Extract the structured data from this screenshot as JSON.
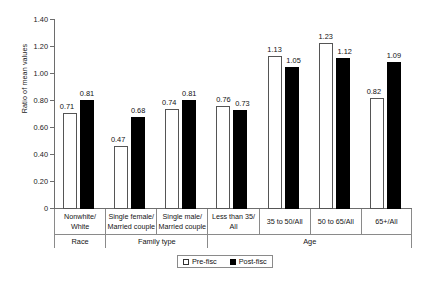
{
  "chart_data": {
    "type": "bar",
    "title": "",
    "xlabel": "",
    "ylabel": "Ratio of mean values",
    "ylim": [
      0,
      1.4
    ],
    "ytick_labels": [
      "0",
      "0.20",
      "0.40",
      "0.60",
      "0.80",
      "1.00",
      "1.20",
      "1.40"
    ],
    "ytick_values": [
      0,
      0.2,
      0.4,
      0.6,
      0.8,
      1.0,
      1.2,
      1.4
    ],
    "grid": false,
    "legend_position": "bottom-center",
    "categories": [
      "Nonwhite/ White",
      "Single female/ Married couple",
      "Single male/ Married couple",
      "Less than 35/ All",
      "35 to 50/All",
      "50 to 65/All",
      "65+/All"
    ],
    "category_lines": [
      [
        "Nonwhite/",
        "White"
      ],
      [
        "Single female/",
        "Married couple"
      ],
      [
        "Single male/",
        "Married couple"
      ],
      [
        "Less than 35/",
        "All"
      ],
      [
        "35 to 50/All",
        ""
      ],
      [
        "50 to 65/All",
        ""
      ],
      [
        "65+/All",
        ""
      ]
    ],
    "groups": [
      {
        "label": "Race",
        "span": 1
      },
      {
        "label": "Family type",
        "span": 2
      },
      {
        "label": "Age",
        "span": 4
      }
    ],
    "series": [
      {
        "name": "Pre-fisc",
        "color": "#ffffff",
        "values": [
          0.71,
          0.47,
          0.74,
          0.76,
          1.13,
          1.23,
          0.82
        ],
        "labels": [
          "0.71",
          "0.47",
          "0.74",
          "0.76",
          "1.13",
          "1.23",
          "0.82"
        ]
      },
      {
        "name": "Post-fisc",
        "color": "#000000",
        "values": [
          0.81,
          0.68,
          0.81,
          0.73,
          1.05,
          1.12,
          1.09
        ],
        "labels": [
          "0.81",
          "0.68",
          "0.81",
          "0.73",
          "1.05",
          "1.12",
          "1.09"
        ]
      }
    ]
  },
  "legend": {
    "items": [
      {
        "label": "Pre-fisc",
        "swatch": "open-square-icon"
      },
      {
        "label": "Post-fisc",
        "swatch": "filled-square-icon"
      }
    ]
  }
}
